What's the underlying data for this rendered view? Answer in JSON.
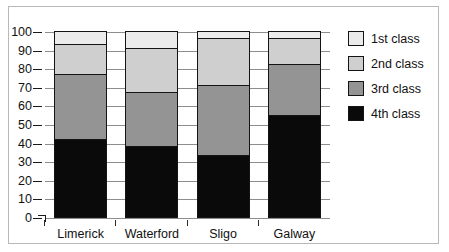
{
  "chart_data": {
    "type": "bar",
    "subtype": "stacked-bar-vertical",
    "title": "",
    "xlabel": "",
    "ylabel": "",
    "ylim": [
      0,
      100
    ],
    "yticks": [
      0,
      10,
      20,
      30,
      40,
      50,
      60,
      70,
      80,
      90,
      100
    ],
    "ytick_labels": [
      "0",
      "10",
      "20",
      "30",
      "40",
      "50",
      "60",
      "70",
      "80",
      "90",
      "100"
    ],
    "grid": true,
    "legend_position": "right",
    "categories": [
      "Limerick",
      "Waterford",
      "Sligo",
      "Galway"
    ],
    "stack_order_bottom_to_top": [
      "4th class",
      "3rd class",
      "2nd class",
      "1st class"
    ],
    "series": [
      {
        "name": "1st class",
        "color": "#ebebeb",
        "values": [
          7,
          9,
          4,
          4
        ]
      },
      {
        "name": "2nd class",
        "color": "#cfcfcf",
        "values": [
          16,
          24,
          25,
          13.5
        ]
      },
      {
        "name": "3rd class",
        "color": "#949494",
        "values": [
          35,
          29,
          37.5,
          27.5
        ]
      },
      {
        "name": "4th class",
        "color": "#0a0a0a",
        "values": [
          42,
          38,
          33.5,
          55
        ]
      }
    ],
    "cumulative_tops": {
      "Limerick": {
        "4th class": 42,
        "3rd class": 77,
        "2nd class": 93,
        "1st class": 100
      },
      "Waterford": {
        "4th class": 38,
        "3rd class": 67,
        "2nd class": 91,
        "1st class": 100
      },
      "Sligo": {
        "4th class": 33.5,
        "3rd class": 71,
        "2nd class": 96,
        "1st class": 100
      },
      "Galway": {
        "4th class": 55,
        "3rd class": 82.5,
        "2nd class": 96,
        "1st class": 100
      }
    }
  },
  "legend": {
    "items": [
      {
        "label": "1st class",
        "color": "#ebebeb"
      },
      {
        "label": "2nd class",
        "color": "#cfcfcf"
      },
      {
        "label": "3rd class",
        "color": "#949494"
      },
      {
        "label": "4th class",
        "color": "#0a0a0a"
      }
    ]
  }
}
